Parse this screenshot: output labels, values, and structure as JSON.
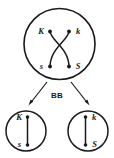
{
  "diagram": {
    "type": "genetics-meiosis-crossing-over",
    "colors": {
      "background": "#ffffff",
      "stroke": "#1a1a1a",
      "cell_fill": "#ffffff"
    },
    "parent_cell": {
      "name": "parent-cell",
      "labels": {
        "top_left": "K",
        "top_right": "k",
        "bottom_left": "s",
        "bottom_right": "S"
      },
      "chromatid_count": 2,
      "centromere_count": 4,
      "crossing_over": true
    },
    "stage_label": "BB",
    "arrows": {
      "left": "arrow-to-left-daughter-cell",
      "right": "arrow-to-right-daughter-cell"
    },
    "daughter_cells": [
      {
        "name": "daughter-cell-left",
        "labels": {
          "top": "K",
          "bottom": "s"
        }
      },
      {
        "name": "daughter-cell-right",
        "labels": {
          "top": "k",
          "bottom": "S"
        }
      }
    ]
  }
}
